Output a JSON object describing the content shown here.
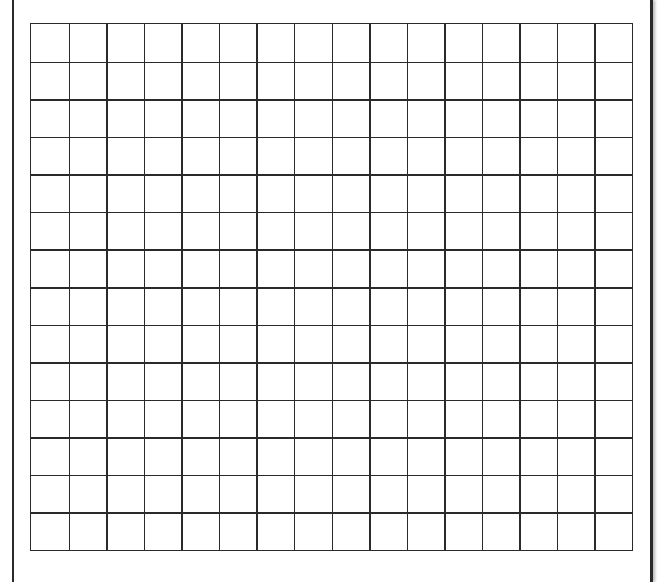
{
  "grid": {
    "columns": 16,
    "rows": 14,
    "line_color": "#2a2a2a",
    "background": "#ffffff"
  },
  "frame": {
    "border_color": "#2a2a2a"
  }
}
